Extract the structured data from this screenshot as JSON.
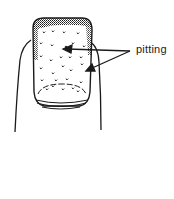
{
  "figure": {
    "annotations": [
      {
        "label": "pitting",
        "arrow_count": 2
      }
    ],
    "colors": {
      "ink": "#1a1a1a",
      "background": "#ffffff"
    }
  }
}
